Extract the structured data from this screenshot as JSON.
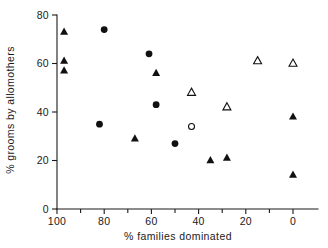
{
  "chart_data": {
    "type": "scatter",
    "title": "",
    "xlabel": "% families dominated",
    "ylabel": "% grooms by allomothers",
    "xlim": [
      105,
      -5
    ],
    "ylim": [
      0,
      82
    ],
    "x_reversed": true,
    "grid": false,
    "legend_position": "none",
    "xticks": [
      100,
      80,
      60,
      40,
      20,
      0
    ],
    "xtick_labels": [
      "100",
      "80",
      "60",
      "40",
      "20",
      "0"
    ],
    "x_minor_ticks": [
      90,
      70,
      50,
      30,
      10
    ],
    "yticks": [
      0,
      20,
      40,
      60,
      80
    ],
    "ytick_labels": [
      "0",
      "20",
      "40",
      "60",
      "80"
    ],
    "series": [
      {
        "name": "filled-triangle",
        "marker": "filled-triangle",
        "points": [
          {
            "x": 97,
            "y": 73
          },
          {
            "x": 97,
            "y": 61
          },
          {
            "x": 97,
            "y": 57
          },
          {
            "x": 58,
            "y": 56
          },
          {
            "x": 67,
            "y": 29
          },
          {
            "x": 35,
            "y": 20
          },
          {
            "x": 28,
            "y": 21
          },
          {
            "x": 0,
            "y": 38
          },
          {
            "x": 0,
            "y": 14
          }
        ]
      },
      {
        "name": "filled-circle",
        "marker": "filled-circle",
        "points": [
          {
            "x": 80,
            "y": 74
          },
          {
            "x": 61,
            "y": 64
          },
          {
            "x": 58,
            "y": 43
          },
          {
            "x": 82,
            "y": 35
          },
          {
            "x": 50,
            "y": 27
          }
        ]
      },
      {
        "name": "open-triangle",
        "marker": "open-triangle",
        "points": [
          {
            "x": 43,
            "y": 48
          },
          {
            "x": 28,
            "y": 42
          },
          {
            "x": 15,
            "y": 61
          },
          {
            "x": 0,
            "y": 60
          }
        ]
      },
      {
        "name": "open-circle",
        "marker": "open-circle",
        "points": [
          {
            "x": 43,
            "y": 34
          }
        ]
      }
    ]
  },
  "colors": {
    "ink": "#111111",
    "axis": "#1a1a1a",
    "background": "#ffffff"
  }
}
